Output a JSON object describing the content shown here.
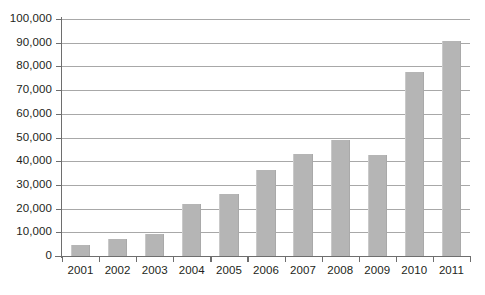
{
  "chart_data": {
    "type": "bar",
    "title": "",
    "subtitle": "",
    "xlabel": "",
    "ylabel": "",
    "categories": [
      "2001",
      "2002",
      "2003",
      "2004",
      "2005",
      "2006",
      "2007",
      "2008",
      "2009",
      "2010",
      "2011"
    ],
    "values": [
      4500,
      7000,
      9500,
      21800,
      26200,
      36300,
      43000,
      48800,
      42600,
      77600,
      90800
    ],
    "series": [
      {
        "name": "",
        "values": [
          4500,
          7000,
          9500,
          21800,
          26200,
          36300,
          43000,
          48800,
          42600,
          77600,
          90800
        ]
      }
    ],
    "ylim": [
      0,
      100000
    ],
    "y_ticks": [
      0,
      10000,
      20000,
      30000,
      40000,
      50000,
      60000,
      70000,
      80000,
      90000,
      100000
    ],
    "y_tick_labels": [
      "0",
      "10,000",
      "20,000",
      "30,000",
      "40,000",
      "50,000",
      "60,000",
      "70,000",
      "80,000",
      "90,000",
      "100,000"
    ],
    "x_tick_labels": [
      "2001",
      "2002",
      "2003",
      "2004",
      "2005",
      "2006",
      "2007",
      "2008",
      "2009",
      "2010",
      "2011"
    ],
    "grid": true,
    "grid_axis": "y",
    "legend": false,
    "legend_position": "none",
    "bar_color": "#b5b5b5",
    "grid_color": "#a8a8a8",
    "axis_color": "#6e6e6e",
    "text_color": "#231f20",
    "background": "#ffffff",
    "annotations": []
  }
}
